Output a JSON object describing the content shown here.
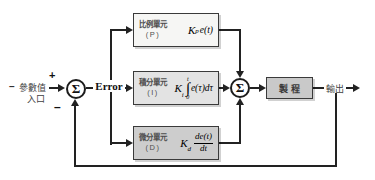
{
  "diagram": {
    "input": {
      "dash": "–",
      "label_line1": "參數值",
      "label_line2": "入口",
      "plus_sign": "+",
      "minus_sign": "–"
    },
    "summer_left": {
      "symbol": "Σ"
    },
    "error_label": "Error",
    "blocks": {
      "p": {
        "name": "比例單元",
        "tag": "(P)",
        "coef": "K",
        "sub": "p",
        "expr": "e(t)"
      },
      "i": {
        "name": "積分單元",
        "tag": "(I)",
        "coef": "K",
        "sub": "i",
        "int_sign": "∫",
        "int_upper": "t",
        "int_lower": "0",
        "expr": "e(τ)dτ"
      },
      "d": {
        "name": "微分單元",
        "tag": "(D)",
        "coef": "K",
        "sub": "d",
        "numer": "de(t)",
        "denom": "dt"
      }
    },
    "summer_right": {
      "symbol": "Σ"
    },
    "process": {
      "name": "製程"
    },
    "output_label": "輸出",
    "colors": {
      "line": "#222222",
      "p_block_bg": "#f6f6f4",
      "i_block_bg": "#e3e3e3",
      "d_block_bg": "#cdcdcd",
      "process_bg": "#c9c9c9",
      "background": "#ffffff"
    }
  }
}
